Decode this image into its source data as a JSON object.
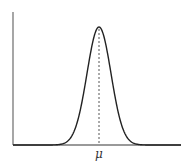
{
  "chart_data": {
    "type": "line",
    "title": "",
    "subtitle": "",
    "xlabel": "",
    "ylabel": "",
    "distribution": "normal",
    "mean_label": "μ",
    "x_tick_labels": [
      "μ"
    ],
    "y_tick_labels": [],
    "annotations": [
      {
        "type": "vertical-dashed-line",
        "at": "μ",
        "from": "baseline",
        "to": "peak"
      }
    ],
    "grid": false,
    "legend": null,
    "x_range_sigma": [
      -7.2,
      6.8
    ],
    "series": [
      {
        "name": "density",
        "x_sigma": [
          -4,
          -3.5,
          -3,
          -2.5,
          -2,
          -1.5,
          -1,
          -0.5,
          0,
          0.5,
          1,
          1.5,
          2,
          2.5,
          3,
          3.5,
          4
        ],
        "relative_height": [
          0.0003,
          0.0022,
          0.0111,
          0.0439,
          0.1353,
          0.3247,
          0.6065,
          0.8825,
          1.0,
          0.8825,
          0.6065,
          0.3247,
          0.1353,
          0.0439,
          0.0111,
          0.0022,
          0.0003
        ]
      }
    ]
  },
  "colors": {
    "axis": "#777777",
    "curve": "#222222",
    "dashed_line": "#555555",
    "label": "#333333"
  },
  "geometry": {
    "origin_x": 13,
    "baseline_y": 145,
    "axis_top_y": 12,
    "axis_right_x": 181,
    "mu_x": 99,
    "peak_y": 27,
    "sigma_px": 12
  }
}
